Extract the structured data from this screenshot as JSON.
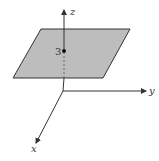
{
  "figure": {
    "plane": {
      "fill": "#bdbdbd",
      "stroke": "#333333",
      "points": [
        [
          41,
          29
        ],
        [
          130,
          29
        ],
        [
          103,
          78
        ],
        [
          13,
          78
        ]
      ]
    },
    "axes": {
      "origin": [
        63,
        91
      ],
      "z": {
        "label": "z",
        "end": [
          64,
          9
        ]
      },
      "y": {
        "label": "y",
        "end": [
          146,
          91
        ]
      },
      "x": {
        "label": "x",
        "end": [
          36,
          143
        ]
      }
    },
    "point": {
      "label": "3",
      "position": [
        64,
        51
      ]
    }
  }
}
